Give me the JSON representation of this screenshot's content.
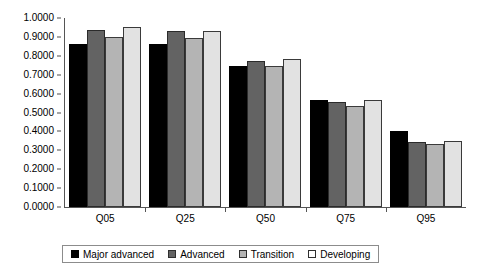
{
  "chart_data": {
    "type": "bar",
    "title": "",
    "subtitle": "",
    "xlabel": "",
    "ylabel": "",
    "categories": [
      "Q05",
      "Q25",
      "Q50",
      "Q75",
      "Q95"
    ],
    "series": [
      {
        "name": "Major advanced",
        "color": "#000000",
        "values": [
          0.865,
          0.865,
          0.745,
          0.565,
          0.4
        ]
      },
      {
        "name": "Advanced",
        "color": "#636363",
        "values": [
          0.935,
          0.93,
          0.775,
          0.555,
          0.345
        ]
      },
      {
        "name": "Transition",
        "color": "#b4b4b4",
        "values": [
          0.9,
          0.895,
          0.745,
          0.535,
          0.335
        ]
      },
      {
        "name": "Developing",
        "color": "#e2e2e2",
        "values": [
          0.955,
          0.93,
          0.785,
          0.565,
          0.35
        ]
      }
    ],
    "ylim": [
      0.0,
      1.0
    ],
    "ytick_labels": [
      "1.0000",
      "0.9000",
      "0.8000",
      "0.7000",
      "0.6000",
      "0.5000",
      "0.4000",
      "0.3000",
      "0.2000",
      "0.1000",
      "0.0000"
    ],
    "ytick_values": [
      1.0,
      0.9,
      0.8,
      0.7,
      0.6,
      0.5,
      0.4,
      0.3,
      0.2,
      0.1,
      0.0
    ],
    "grid": false,
    "legend_position": "bottom"
  }
}
